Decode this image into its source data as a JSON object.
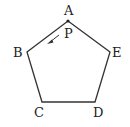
{
  "diagram": {
    "shape": "regular pentagon",
    "vertices": [
      {
        "label": "A",
        "x": 68,
        "y": 21
      },
      {
        "label": "E",
        "x": 110,
        "y": 52
      },
      {
        "label": "D",
        "x": 95,
        "y": 102
      },
      {
        "label": "C",
        "x": 42,
        "y": 102
      },
      {
        "label": "B",
        "x": 27,
        "y": 52
      }
    ],
    "point": {
      "label": "P",
      "at_vertex": "A",
      "direction": "toward B"
    },
    "labels": {
      "A": "A",
      "B": "B",
      "C": "C",
      "D": "D",
      "E": "E",
      "P": "P"
    },
    "colors": {
      "stroke": "#333333",
      "text": "#222222",
      "background": "#ffffff"
    }
  }
}
